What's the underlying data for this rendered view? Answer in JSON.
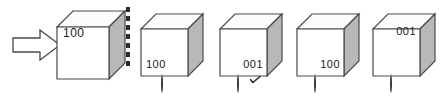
{
  "figure": {
    "type": "multiple-choice-cube-rotation",
    "prompt_arrow_icon": "right-arrow-icon",
    "divider_icon": "vertical-dashed-divider"
  },
  "reference": {
    "cube_label": "100",
    "label_position": "top-left",
    "name": "reference-cube"
  },
  "options": [
    {
      "id": "option-a",
      "cube_label": "100",
      "label_position": "bottom-left",
      "selected": false,
      "marker": ""
    },
    {
      "id": "option-b",
      "cube_label": "001",
      "label_position": "bottom-right",
      "selected": true,
      "marker": "check-mark"
    },
    {
      "id": "option-c",
      "cube_label": "100",
      "label_position": "bottom-right",
      "selected": false,
      "marker": ""
    },
    {
      "id": "option-d",
      "cube_label": "001",
      "label_position": "top-right",
      "selected": false,
      "marker": ""
    }
  ],
  "colors": {
    "outline": "#4a4a4a",
    "front_face": "#ffffff",
    "top_face": "#fcfcfc",
    "side_face": "#b8b8b8",
    "text": "#1a1a1a",
    "dash": "#2b2b2b"
  }
}
